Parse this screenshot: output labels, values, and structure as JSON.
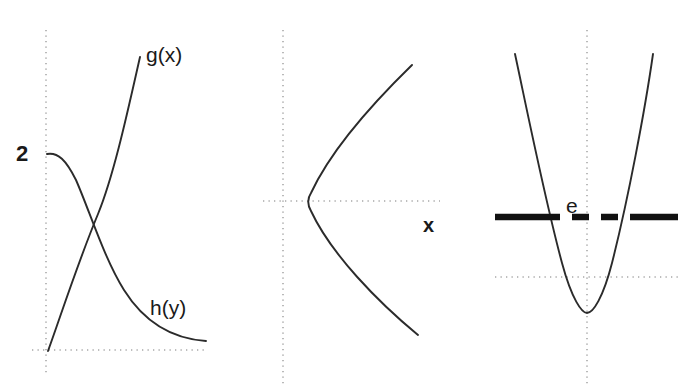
{
  "figure": {
    "width": 691,
    "height": 387,
    "background": "#ffffff",
    "curve_color": "#2b2b2b",
    "axis_color": "#a8a8a8",
    "level_color": "#111111"
  },
  "panels": [
    {
      "id": "panel-left",
      "description": "Two intersecting curves: an increasing nearly-linear curve g(x) and a decreasing exponential-decay curve h(y) starting at value 2 on the vertical axis.",
      "axes": {
        "vertical_x": 46,
        "vertical_y1": 30,
        "vertical_y2": 376,
        "horizontal_y": 350,
        "horizontal_x1": 32,
        "horizontal_x2": 206
      },
      "labels": [
        {
          "name": "y-axis-value-2",
          "text": "2",
          "x": 16,
          "y": 143
        },
        {
          "name": "curve-label-gx",
          "text": "g(x)",
          "x": 146,
          "y": 44
        },
        {
          "name": "curve-label-hy",
          "text": "h(y)",
          "x": 150,
          "y": 297
        }
      ],
      "curves": [
        {
          "name": "curve-g",
          "path": "M 48 351 C 60 318 78 262 98 214 C 114 175 128 110 140 57"
        },
        {
          "name": "curve-h",
          "path": "M 47 154 C 58 152 66 160 76 180 C 90 212 104 258 124 290 C 146 325 176 339 206 341"
        }
      ]
    },
    {
      "id": "panel-middle",
      "description": "Sideways parabola opening to the right with vertex on the horizontal axis; variable label x on the right.",
      "axes": {
        "vertical_x": 283,
        "vertical_y1": 30,
        "vertical_y2": 384,
        "horizontal_y": 201,
        "horizontal_x1": 263,
        "horizontal_x2": 440
      },
      "labels": [
        {
          "name": "variable-label-x",
          "text": "x",
          "x": 423,
          "y": 215
        }
      ],
      "curves": [
        {
          "name": "curve-sideways-parabola",
          "path": "M 412 65 C 372 104 330 152 311 193 C 307 199 307 204 311 211 C 331 254 378 302 418 335"
        }
      ]
    },
    {
      "id": "panel-right",
      "description": "Upward-opening parabola crossed by a thick horizontal energy level line labelled e; the level line is solid outside the parabola and dashed inside it.",
      "axes": {
        "vertical_x": 587,
        "vertical_y1": 30,
        "vertical_y2": 384,
        "horizontal_y": 277,
        "horizontal_x1": 495,
        "horizontal_x2": 678
      },
      "labels": [
        {
          "name": "level-label-e",
          "text": "e",
          "x": 566,
          "y": 195
        }
      ],
      "curves": [
        {
          "name": "curve-upward-parabola",
          "path": "M 515 54 C 527 110 545 200 562 263 C 572 300 582 313 587 313 C 593 313 603 298 612 263 C 628 200 645 110 653 54"
        }
      ],
      "level_line": {
        "y": 217,
        "solid_left": {
          "x1": 495,
          "x2": 543
        },
        "dashed_middle": {
          "x1": 543,
          "x2": 632
        },
        "solid_right": {
          "x1": 632,
          "x2": 678
        }
      }
    }
  ]
}
